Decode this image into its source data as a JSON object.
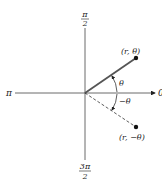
{
  "diagram": {
    "type": "polar-coordinate-symmetry",
    "axes": {
      "top_label": {
        "numerator": "π",
        "denominator": "2"
      },
      "bottom_label": {
        "numerator": "3π",
        "denominator": "2"
      },
      "left_label": "π",
      "right_label": "0"
    },
    "points": [
      {
        "label": "(r, θ)",
        "style": "solid"
      },
      {
        "label": "(r, −θ)",
        "style": "dashed"
      }
    ],
    "angles": [
      {
        "label": "θ"
      },
      {
        "label": "−θ"
      }
    ],
    "colors": {
      "ink": "#222222",
      "background": "#ffffff"
    }
  }
}
